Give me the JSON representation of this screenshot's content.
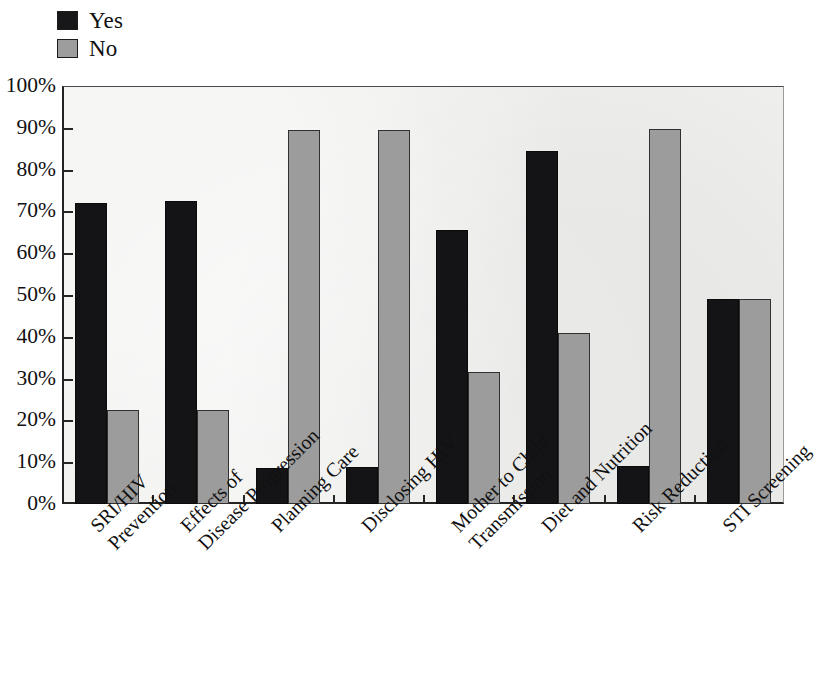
{
  "legend": {
    "items": [
      {
        "label": "Yes",
        "color": "#141416",
        "key": "yes"
      },
      {
        "label": "No",
        "color": "#9c9c9c",
        "key": "no"
      }
    ]
  },
  "axes": {
    "y_ticks": [
      "100%",
      "90%",
      "80%",
      "70%",
      "60%",
      "50%",
      "40%",
      "30%",
      "20%",
      "10%",
      "0%"
    ],
    "y_min": 0,
    "y_max": 100
  },
  "chart_data": {
    "type": "bar",
    "title": "",
    "xlabel": "",
    "ylabel": "",
    "ylim": [
      0,
      100
    ],
    "grid": false,
    "legend_position": "top-left",
    "categories": [
      "SRI/HIV Prevention",
      "Effects of Disease Progression",
      "Planning Care",
      "Disclosing HIV",
      "Mother to Child Transmission",
      "Diet and Nutrition",
      "Risk Reduction",
      "STI Screening"
    ],
    "category_lines": [
      [
        "SRI/HIV",
        "Prevention"
      ],
      [
        "Effects of",
        "Disease Progression"
      ],
      [
        "Planning Care",
        ""
      ],
      [
        "Disclosing HIV",
        ""
      ],
      [
        "Mother to Child",
        "Transmission"
      ],
      [
        "Diet and Nutrition",
        ""
      ],
      [
        "Risk Reduction",
        ""
      ],
      [
        "STI Screening",
        ""
      ]
    ],
    "series": [
      {
        "name": "Yes",
        "color": "#141416",
        "values": [
          72,
          72.5,
          8.5,
          8.8,
          65.5,
          84.5,
          9,
          49
        ]
      },
      {
        "name": "No",
        "color": "#9c9c9c",
        "values": [
          22.5,
          22.5,
          89.5,
          89.5,
          31.5,
          41,
          89.8,
          49
        ]
      }
    ]
  }
}
